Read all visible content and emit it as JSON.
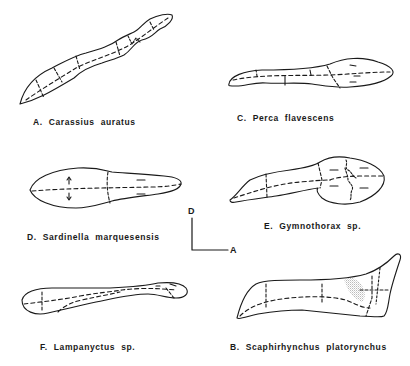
{
  "figure": {
    "panels": [
      {
        "id": "A",
        "label": "A. Carassius auratus"
      },
      {
        "id": "C",
        "label": "C. Perca flavescens"
      },
      {
        "id": "D",
        "label": "D. Sardinella marquesensis"
      },
      {
        "id": "E",
        "label": "E. Gymnothorax sp."
      },
      {
        "id": "F",
        "label": "F. Lampanyctus sp."
      },
      {
        "id": "B",
        "label": "B. Scaphirhynchus platorynchus"
      }
    ],
    "orientation": {
      "dorsal": "D",
      "anterior": "A"
    },
    "colors": {
      "ink": "#1a1a1a",
      "background": "#ffffff",
      "stipple": "#888888"
    }
  }
}
